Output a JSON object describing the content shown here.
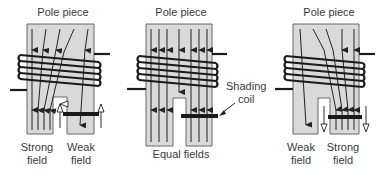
{
  "figures": [
    {
      "id": "strong-weak",
      "title": "Pole piece",
      "labels": [
        {
          "text_line1": "Strong",
          "text_line2": "field"
        },
        {
          "text_line1": "Weak",
          "text_line2": "field"
        }
      ]
    },
    {
      "id": "equal",
      "title": "Pole piece",
      "caption": "Equal fields",
      "callout_line1": "Shading",
      "callout_line2": "coil"
    },
    {
      "id": "weak-strong",
      "title": "Pole piece",
      "labels": [
        {
          "text_line1": "Weak",
          "text_line2": "field"
        },
        {
          "text_line1": "Strong",
          "text_line2": "field"
        }
      ]
    }
  ],
  "colors": {
    "pole_fill": "#d9d9d9",
    "pole_stroke": "#555555",
    "coil": "#1a1a1a",
    "arrow": "#222222"
  }
}
